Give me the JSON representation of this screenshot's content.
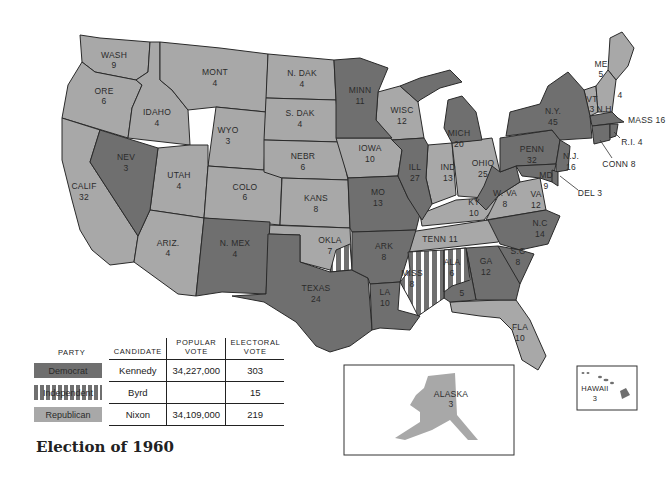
{
  "title": "Election of 1960",
  "colors": {
    "democrat": "#6f6f6f",
    "republican": "#a8a8a8",
    "independent_stripe": "#ffffff",
    "border": "#2a2a2a"
  },
  "legend": {
    "headers": {
      "party": "PARTY",
      "candidate": "CANDIDATE",
      "popular_vote": "POPULAR VOTE",
      "electoral_vote": "ELECTORAL VOTE"
    },
    "rows": [
      {
        "party": "Democrat",
        "candidate": "Kennedy",
        "popular_vote": "34,227,000",
        "electoral_vote": "303"
      },
      {
        "party": "Independent",
        "candidate": "Byrd",
        "popular_vote": "",
        "electoral_vote": "15"
      },
      {
        "party": "Republican",
        "candidate": "Nixon",
        "popular_vote": "34,109,000",
        "electoral_vote": "219"
      }
    ]
  },
  "states": {
    "WASH": {
      "name": "WASH",
      "ev": "9",
      "party": "R"
    },
    "ORE": {
      "name": "ORE",
      "ev": "6",
      "party": "R"
    },
    "CALIF": {
      "name": "CALIF",
      "ev": "32",
      "party": "R"
    },
    "IDAHO": {
      "name": "IDAHO",
      "ev": "4",
      "party": "R"
    },
    "NEV": {
      "name": "NEV",
      "ev": "3",
      "party": "D"
    },
    "MONT": {
      "name": "MONT",
      "ev": "4",
      "party": "R"
    },
    "WYO": {
      "name": "WYO",
      "ev": "3",
      "party": "R"
    },
    "UTAH": {
      "name": "UTAH",
      "ev": "4",
      "party": "R"
    },
    "ARIZ": {
      "name": "ARIZ.",
      "ev": "4",
      "party": "R"
    },
    "COLO": {
      "name": "COLO",
      "ev": "6",
      "party": "R"
    },
    "NMEX": {
      "name": "N. MEX",
      "ev": "4",
      "party": "D"
    },
    "NDAK": {
      "name": "N. DAK",
      "ev": "4",
      "party": "R"
    },
    "SDAK": {
      "name": "S. DAK",
      "ev": "4",
      "party": "R"
    },
    "NEBR": {
      "name": "NEBR",
      "ev": "6",
      "party": "R"
    },
    "KANS": {
      "name": "KANS",
      "ev": "8",
      "party": "R"
    },
    "OKLA": {
      "name": "OKLA",
      "ev": "7",
      "party": "R",
      "independent_ev": "1"
    },
    "TEXAS": {
      "name": "TEXAS",
      "ev": "24",
      "party": "D"
    },
    "MINN": {
      "name": "MINN",
      "ev": "11",
      "party": "D"
    },
    "IOWA": {
      "name": "IOWA",
      "ev": "10",
      "party": "R"
    },
    "MO": {
      "name": "MO",
      "ev": "13",
      "party": "D"
    },
    "ARK": {
      "name": "ARK",
      "ev": "8",
      "party": "D"
    },
    "LA": {
      "name": "LA",
      "ev": "10",
      "party": "D"
    },
    "WISC": {
      "name": "WISC",
      "ev": "12",
      "party": "R"
    },
    "ILL": {
      "name": "ILL",
      "ev": "27",
      "party": "D"
    },
    "MICH": {
      "name": "MICH",
      "ev": "20",
      "party": "D"
    },
    "IND": {
      "name": "IND",
      "ev": "13",
      "party": "R"
    },
    "OHIO": {
      "name": "OHIO",
      "ev": "25",
      "party": "R"
    },
    "KY": {
      "name": "KY",
      "ev": "10",
      "party": "R"
    },
    "TENN": {
      "name": "TENN",
      "ev": "11",
      "party": "R"
    },
    "MISS": {
      "name": "MISS",
      "ev": "8",
      "party": "I"
    },
    "ALA": {
      "name": "ALA",
      "ev": "6",
      "party": "I",
      "democrat_ev": "5"
    },
    "GA": {
      "name": "GA",
      "ev": "12",
      "party": "D"
    },
    "FLA": {
      "name": "FLA",
      "ev": "10",
      "party": "R"
    },
    "SC": {
      "name": "S.C",
      "ev": "8",
      "party": "D"
    },
    "NC": {
      "name": "N.C",
      "ev": "14",
      "party": "D"
    },
    "VA": {
      "name": "VA",
      "ev": "12",
      "party": "R"
    },
    "WVA": {
      "name": "W. VA",
      "ev": "8",
      "party": "D"
    },
    "PENN": {
      "name": "PENN",
      "ev": "32",
      "party": "D"
    },
    "NY": {
      "name": "N.Y.",
      "ev": "45",
      "party": "D"
    },
    "NJ": {
      "name": "N.J.",
      "ev": "16",
      "party": "D"
    },
    "MD": {
      "name": "MD",
      "ev": "9",
      "party": "D"
    },
    "DEL": {
      "name": "DEL",
      "ev": "3",
      "party": "D"
    },
    "VT": {
      "name": "VT",
      "ev": "3",
      "party": "R"
    },
    "NH": {
      "name": "N.H",
      "ev": "4",
      "party": "R"
    },
    "ME": {
      "name": "ME",
      "ev": "5",
      "party": "R"
    },
    "MASS": {
      "name": "MASS",
      "ev": "16",
      "party": "D"
    },
    "RI": {
      "name": "R.I.",
      "ev": "4",
      "party": "D"
    },
    "CONN": {
      "name": "CONN",
      "ev": "8",
      "party": "D"
    },
    "ALASKA": {
      "name": "ALASKA",
      "ev": "3",
      "party": "R"
    },
    "HAWAII": {
      "name": "HAWAII",
      "ev": "3",
      "party": "D"
    }
  }
}
